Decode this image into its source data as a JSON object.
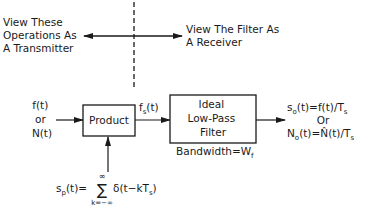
{
  "top": {
    "left_note": [
      "View These",
      "Operations As",
      "A Transmitter"
    ],
    "right_note": [
      "View The Filter As",
      "A Receiver"
    ]
  },
  "input": {
    "line1": "f(t)",
    "line2": "or",
    "line3": "N(t)"
  },
  "product_block": {
    "label": "Product"
  },
  "intermediate_signal": {
    "base": "f",
    "sub": "s",
    "arg": "(t)"
  },
  "filter_block": {
    "lines": [
      "Ideal",
      "Low-Pass",
      "Filter"
    ],
    "bandwidth_label": "Bandwidth=W",
    "bandwidth_sub": "f"
  },
  "output": {
    "line1_a": "s",
    "line1_sub": "o",
    "line1_b": "(t)=f(t)/T",
    "line1_sub2": "s",
    "line2": "Or",
    "line3_a": "N",
    "line3_sub": "o",
    "line3_b": "(t)=",
    "line3_hat": "N̂",
    "line3_c": "(t)/T",
    "line3_sub2": "s"
  },
  "sampling": {
    "lhs_a": "s",
    "lhs_sub": "p",
    "lhs_b": "(t)=",
    "sum_symbol": "∑",
    "sum_upper": "∞",
    "sum_lower": "k=−∞",
    "rhs_a": "δ(t−kT",
    "rhs_sub": "s",
    "rhs_b": ")"
  }
}
